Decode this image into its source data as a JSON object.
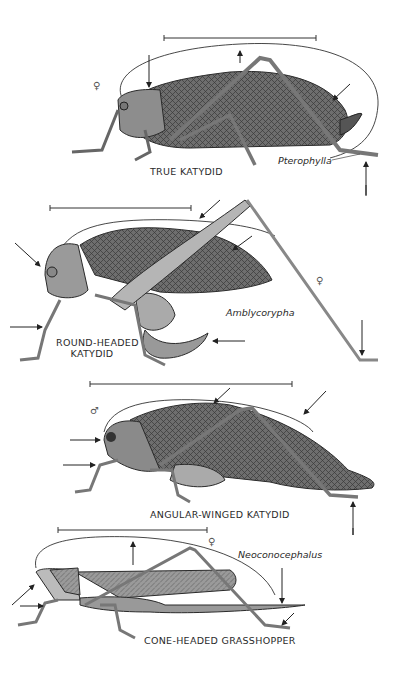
{
  "plate": {
    "background": "#ffffff",
    "ink_color": "#2a2a2a",
    "specimens": [
      {
        "common_name": "TRUE KATYDID",
        "genus": "Pterophylla",
        "sex_symbol": "♀"
      },
      {
        "common_name_line1": "ROUND-HEADED",
        "common_name_line2": "KATYDID",
        "genus": "Amblycorypha",
        "sex_symbol": "♀"
      },
      {
        "common_name": "ANGULAR-WINGED KATYDID",
        "sex_symbol": "♂"
      },
      {
        "common_name": "CONE-HEADED GRASSHOPPER",
        "genus": "Neoconocephalus",
        "sex_symbol": "♀"
      }
    ]
  }
}
